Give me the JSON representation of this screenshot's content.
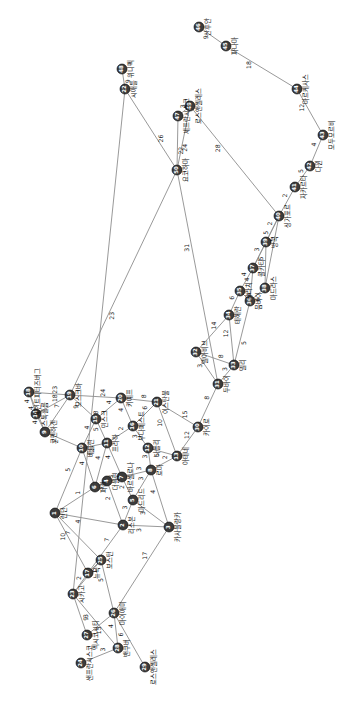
{
  "figure": {
    "type": "graph-network-diagram",
    "orientation_deg": 90,
    "background": "#ffffff",
    "node_color": "#3c3c3c",
    "node_label_color": "#0d0d0d",
    "edge_color": "#8d8d8d",
    "edge_weight_color": "#1a1a1a",
    "node_radius": 5.0
  },
  "chart_data": {
    "type": "graph",
    "title": "",
    "node_count": 50,
    "edge_count": 69,
    "nodes": [
      {
        "id": "1",
        "label": "런던",
        "x": 55,
        "y": 513
      },
      {
        "id": "2",
        "label": "리스본",
        "x": 123,
        "y": 525
      },
      {
        "id": "3",
        "label": "카사블랑카",
        "x": 169,
        "y": 527
      },
      {
        "id": "4",
        "label": "더블린",
        "x": 107,
        "y": 481
      },
      {
        "id": "5",
        "label": "마드리드",
        "x": 133,
        "y": 500
      },
      {
        "id": "6",
        "label": "파리",
        "x": 95,
        "y": 487
      },
      {
        "id": "7",
        "label": "바르셀로나",
        "x": 122,
        "y": 477
      },
      {
        "id": "8",
        "label": "로마",
        "x": 151,
        "y": 470
      },
      {
        "id": "9",
        "label": "코펜하겐",
        "x": 45,
        "y": 432
      },
      {
        "id": "10",
        "label": "베를린",
        "x": 82,
        "y": 448
      },
      {
        "id": "11",
        "label": "프라하",
        "x": 107,
        "y": 443
      },
      {
        "id": "12",
        "label": "나폴리",
        "x": 148,
        "y": 448
      },
      {
        "id": "13",
        "label": "아테네",
        "x": 177,
        "y": 456
      },
      {
        "id": "14",
        "label": "스톡홀름",
        "x": 36,
        "y": 414
      },
      {
        "id": "15",
        "label": "민스크",
        "x": 96,
        "y": 419
      },
      {
        "id": "16",
        "label": "부다페스트",
        "x": 133,
        "y": 426
      },
      {
        "id": "17",
        "label": "뉴욕",
        "x": 88,
        "y": 573
      },
      {
        "id": "18",
        "label": "세인트피터즈버그",
        "x": 29,
        "y": 392
      },
      {
        "id": "19",
        "label": "모스크바",
        "x": 70,
        "y": 395
      },
      {
        "id": "20",
        "label": "키예프",
        "x": 121,
        "y": 398
      },
      {
        "id": "21",
        "label": "이스탄불",
        "x": 157,
        "y": 402
      },
      {
        "id": "22",
        "label": "시애틀",
        "x": 125,
        "y": 89
      },
      {
        "id": "23",
        "label": "시카고",
        "x": 73,
        "y": 594
      },
      {
        "id": "24",
        "label": "샌프란시스코",
        "x": 81,
        "y": 663
      },
      {
        "id": "25",
        "label": "보스턴",
        "x": 101,
        "y": 560
      },
      {
        "id": "26",
        "label": "마이애미",
        "x": 114,
        "y": 613
      },
      {
        "id": "27",
        "label": "멕시코시티",
        "x": 87,
        "y": 635
      },
      {
        "id": "28",
        "label": "밴쿠버",
        "x": 118,
        "y": 648
      },
      {
        "id": "29",
        "label": "로스앤젤레스",
        "x": 145,
        "y": 667
      },
      {
        "id": "30",
        "label": "카이로",
        "x": 198,
        "y": 427
      },
      {
        "id": "31",
        "label": "두바이",
        "x": 218,
        "y": 384
      },
      {
        "id": "32",
        "label": "텔아비브",
        "x": 196,
        "y": 352
      },
      {
        "id": "33",
        "label": "델리",
        "x": 234,
        "y": 365
      },
      {
        "id": "34",
        "label": "테헤란",
        "x": 229,
        "y": 315
      },
      {
        "id": "35",
        "label": "카라치",
        "x": 240,
        "y": 291
      },
      {
        "id": "36",
        "label": "뭄바이",
        "x": 250,
        "y": 301
      },
      {
        "id": "37",
        "label": "콜카타",
        "x": 253,
        "y": 268
      },
      {
        "id": "38",
        "label": "마드라스",
        "x": 265,
        "y": 288
      },
      {
        "id": "39",
        "label": "방콕",
        "x": 266,
        "y": 242
      },
      {
        "id": "40",
        "label": "싱가포르",
        "x": 279,
        "y": 216
      },
      {
        "id": "41",
        "label": "자카르타",
        "x": 295,
        "y": 187
      },
      {
        "id": "42",
        "label": "다윈",
        "x": 310,
        "y": 166
      },
      {
        "id": "43",
        "label": "모두모르비",
        "x": 323,
        "y": 135
      },
      {
        "id": "44",
        "label": "마르케사스",
        "x": 297,
        "y": 89
      },
      {
        "id": "45",
        "label": "파나마",
        "x": 226,
        "y": 46
      },
      {
        "id": "46",
        "label": "산후안",
        "x": 199,
        "y": 27
      },
      {
        "id": "47",
        "label": "세프란시스코",
        "x": 178,
        "y": 116
      },
      {
        "id": "48",
        "label": "위니펙",
        "x": 122,
        "y": 69
      },
      {
        "id": "49",
        "label": "로스앤젤레스",
        "x": 190,
        "y": 106
      },
      {
        "id": "50",
        "label": "요코하마",
        "x": 177,
        "y": 170
      }
    ],
    "edges": [
      {
        "source": "46",
        "target": "45",
        "weight": "9"
      },
      {
        "source": "45",
        "target": "44",
        "weight": "18"
      },
      {
        "source": "44",
        "target": "43",
        "weight": "12"
      },
      {
        "source": "43",
        "target": "42",
        "weight": "4"
      },
      {
        "source": "42",
        "target": "41",
        "weight": "5"
      },
      {
        "source": "41",
        "target": "40",
        "weight": "2"
      },
      {
        "source": "40",
        "target": "39",
        "weight": "2"
      },
      {
        "source": "40",
        "target": "38",
        "weight": "4"
      },
      {
        "source": "40",
        "target": "37",
        "weight": "5"
      },
      {
        "source": "39",
        "target": "37",
        "weight": "3"
      },
      {
        "source": "39",
        "target": "38",
        "weight": "5"
      },
      {
        "source": "37",
        "target": "36",
        "weight": "4"
      },
      {
        "source": "37",
        "target": "35",
        "weight": "4"
      },
      {
        "source": "36",
        "target": "38",
        "weight": "6"
      },
      {
        "source": "36",
        "target": "35",
        "weight": "4"
      },
      {
        "source": "35",
        "target": "34",
        "weight": "6"
      },
      {
        "source": "34",
        "target": "33",
        "weight": "12"
      },
      {
        "source": "34",
        "target": "32",
        "weight": "14"
      },
      {
        "source": "33",
        "target": "36",
        "weight": "5"
      },
      {
        "source": "33",
        "target": "32",
        "weight": "8"
      },
      {
        "source": "33",
        "target": "31",
        "weight": "3"
      },
      {
        "source": "32",
        "target": "31",
        "weight": "3"
      },
      {
        "source": "31",
        "target": "30",
        "weight": "8"
      },
      {
        "source": "30",
        "target": "21",
        "weight": "15"
      },
      {
        "source": "30",
        "target": "13",
        "weight": "12"
      },
      {
        "source": "21",
        "target": "20",
        "weight": "8"
      },
      {
        "source": "21",
        "target": "13",
        "weight": "10"
      },
      {
        "source": "21",
        "target": "16",
        "weight": "6"
      },
      {
        "source": "20",
        "target": "19",
        "weight": "24"
      },
      {
        "source": "20",
        "target": "15",
        "weight": "4"
      },
      {
        "source": "20",
        "target": "16",
        "weight": "4"
      },
      {
        "source": "19",
        "target": "50",
        "weight": "23"
      },
      {
        "source": "19",
        "target": "18",
        "weight": "23"
      },
      {
        "source": "19",
        "target": "14",
        "weight": "18"
      },
      {
        "source": "19",
        "target": "15",
        "weight": "9"
      },
      {
        "source": "19",
        "target": "9",
        "weight": "7"
      },
      {
        "source": "18",
        "target": "14",
        "weight": "4"
      },
      {
        "source": "18",
        "target": "9",
        "weight": "4"
      },
      {
        "source": "14",
        "target": "9",
        "weight": "4"
      },
      {
        "source": "9",
        "target": "10",
        "weight": "2"
      },
      {
        "source": "15",
        "target": "10",
        "weight": "4"
      },
      {
        "source": "15",
        "target": "11",
        "weight": "5"
      },
      {
        "source": "16",
        "target": "11",
        "weight": "2"
      },
      {
        "source": "16",
        "target": "12",
        "weight": "3"
      },
      {
        "source": "10",
        "target": "11",
        "weight": "2"
      },
      {
        "source": "10",
        "target": "6",
        "weight": "4"
      },
      {
        "source": "10",
        "target": "1",
        "weight": "5"
      },
      {
        "source": "11",
        "target": "6",
        "weight": "4"
      },
      {
        "source": "11",
        "target": "7",
        "weight": "4"
      },
      {
        "source": "12",
        "target": "8",
        "weight": "3"
      },
      {
        "source": "12",
        "target": "13",
        "weight": "5"
      },
      {
        "source": "13",
        "target": "8",
        "weight": "2"
      },
      {
        "source": "8",
        "target": "7",
        "weight": "3"
      },
      {
        "source": "8",
        "target": "5",
        "weight": "3"
      },
      {
        "source": "8",
        "target": "3",
        "weight": "4"
      },
      {
        "source": "7",
        "target": "6",
        "weight": "3"
      },
      {
        "source": "7",
        "target": "5",
        "weight": "2"
      },
      {
        "source": "6",
        "target": "1",
        "weight": "1"
      },
      {
        "source": "6",
        "target": "4",
        "weight": "3"
      },
      {
        "source": "5",
        "target": "2",
        "weight": "3"
      },
      {
        "source": "5",
        "target": "3",
        "weight": "3"
      },
      {
        "source": "4",
        "target": "2",
        "weight": "2"
      },
      {
        "source": "2",
        "target": "3",
        "weight": "3"
      },
      {
        "source": "1",
        "target": "2",
        "weight": "4"
      },
      {
        "source": "1",
        "target": "25",
        "weight": "7"
      },
      {
        "source": "1",
        "target": "17",
        "weight": "10"
      },
      {
        "source": "2",
        "target": "17",
        "weight": "7"
      },
      {
        "source": "3",
        "target": "26",
        "weight": "17"
      },
      {
        "source": "17",
        "target": "25",
        "weight": "1"
      },
      {
        "source": "17",
        "target": "23",
        "weight": "2"
      },
      {
        "source": "25",
        "target": "23",
        "weight": "3"
      },
      {
        "source": "25",
        "target": "26",
        "weight": "5"
      },
      {
        "source": "23",
        "target": "22",
        "weight": "8"
      },
      {
        "source": "23",
        "target": "28",
        "weight": "3"
      },
      {
        "source": "26",
        "target": "28",
        "weight": "4"
      },
      {
        "source": "26",
        "target": "29",
        "weight": "6"
      },
      {
        "source": "28",
        "target": "24",
        "weight": "3"
      },
      {
        "source": "22",
        "target": "48",
        "weight": "9"
      },
      {
        "source": "50",
        "target": "47",
        "weight": "22"
      },
      {
        "source": "50",
        "target": "22",
        "weight": "26"
      },
      {
        "source": "50",
        "target": "49",
        "weight": "24"
      },
      {
        "source": "50",
        "target": "31",
        "weight": "31"
      },
      {
        "source": "49",
        "target": "47",
        "weight": "3"
      },
      {
        "source": "49",
        "target": "40",
        "weight": "28"
      },
      {
        "source": "27",
        "target": "26",
        "weight": "15"
      },
      {
        "source": "27",
        "target": "23",
        "weight": "9"
      }
    ]
  }
}
